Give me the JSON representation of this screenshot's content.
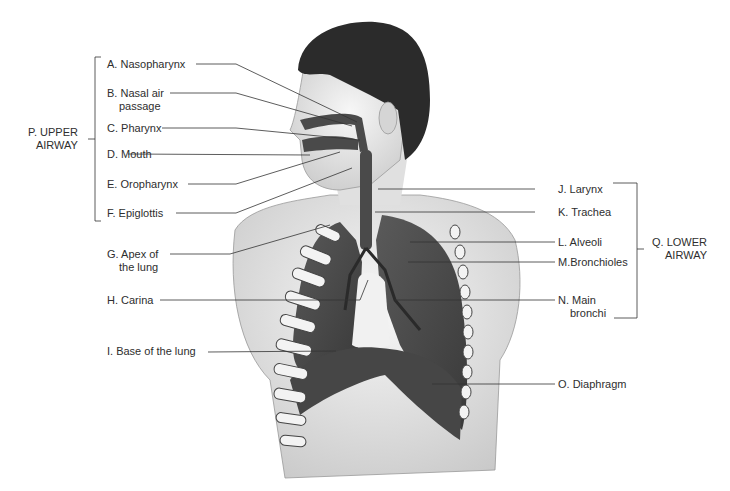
{
  "diagram": {
    "groups": {
      "upper": {
        "line1": "P. UPPER",
        "line2": "AIRWAY"
      },
      "lower": {
        "line1": "Q. LOWER",
        "line2": "AIRWAY"
      }
    },
    "labels": {
      "A": {
        "line1": "A. Nasopharynx"
      },
      "B": {
        "line1": "B. Nasal air",
        "line2": "passage"
      },
      "C": {
        "line1": "C. Pharynx"
      },
      "D": {
        "line1": "D. Mouth"
      },
      "E": {
        "line1": "E. Oropharynx"
      },
      "F": {
        "line1": "F. Epiglottis"
      },
      "G": {
        "line1": "G. Apex of",
        "line2": "the lung"
      },
      "H": {
        "line1": "H. Carina"
      },
      "I": {
        "line1": "I.  Base of the lung"
      },
      "J": {
        "line1": "J. Larynx"
      },
      "K": {
        "line1": "K. Trachea"
      },
      "L": {
        "line1": "L. Alveoli"
      },
      "M": {
        "line1": "M.Bronchioles"
      },
      "N": {
        "line1": "N. Main",
        "line2": "bronchi"
      },
      "O": {
        "line1": "O. Diaphragm"
      }
    },
    "colors": {
      "organ": "#4a4a4a",
      "skin": "#e8e8e8",
      "hair": "#2b2b2b",
      "line": "#333333"
    }
  }
}
